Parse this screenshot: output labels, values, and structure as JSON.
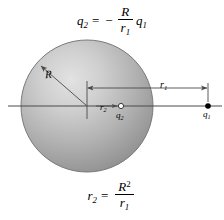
{
  "figure": {
    "background_color": "#ffffff",
    "line_color": "#4a4a4a",
    "text_color": "#000000",
    "sphere": {
      "fill_light": "#d8d8d8",
      "fill_mid": "#a8a8a8",
      "fill_dark": "#8a8a8a",
      "edge_color": "#6b6b6b"
    }
  },
  "equations": {
    "top": {
      "lhs_var": "q",
      "lhs_sub": "2",
      "equals": "=",
      "minus": "−",
      "numerator": "R",
      "denominator_var": "r",
      "denominator_sub": "1",
      "factor_var": "q",
      "factor_sub": "1",
      "plain": "q2 = - (R / r1) q1"
    },
    "bottom": {
      "lhs_var": "r",
      "lhs_sub": "2",
      "equals": "=",
      "numerator": "R",
      "numerator_sup": "2",
      "denominator_var": "r",
      "denominator_sub": "1",
      "plain": "r2 = R^2 / r1"
    }
  },
  "labels": {
    "radius": {
      "var": "R",
      "sub": ""
    },
    "distance_outer": {
      "var": "r",
      "sub": "1"
    },
    "distance_inner": {
      "var": "r",
      "sub": "2"
    },
    "charge_image": {
      "var": "q",
      "sub": "2"
    },
    "charge_source": {
      "var": "q",
      "sub": "1"
    }
  },
  "markers": {
    "charge_source_style": "filled-dot",
    "charge_image_style": "open-circle",
    "axis": "horizontal-center-line"
  }
}
